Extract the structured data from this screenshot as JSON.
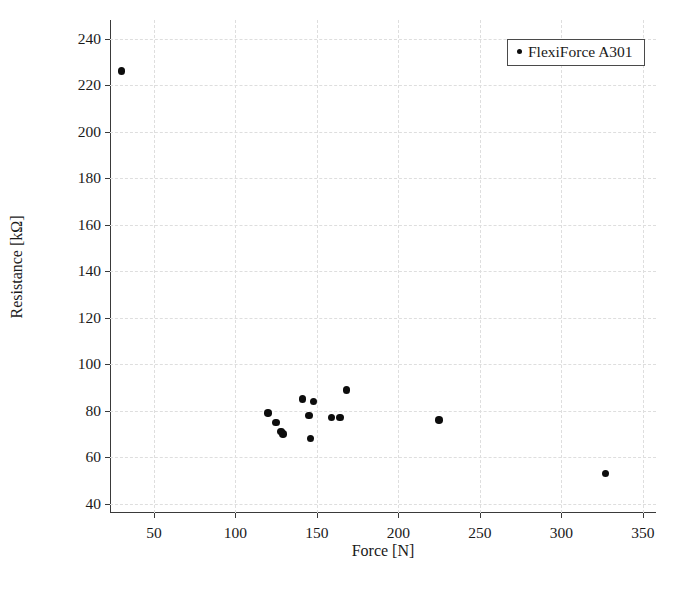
{
  "chart_data": {
    "type": "scatter",
    "title": "",
    "xlabel": "Force [N]",
    "ylabel": "Resistance [kΩ]",
    "xlim": [
      23,
      358
    ],
    "ylim": [
      36,
      248
    ],
    "xticks": [
      50,
      100,
      150,
      200,
      250,
      300,
      350
    ],
    "yticks": [
      40,
      60,
      80,
      100,
      120,
      140,
      160,
      180,
      200,
      220,
      240
    ],
    "grid": true,
    "legend_position": "top-right",
    "marker_color": "#0d0d0d",
    "grid_color": "#dedede",
    "axis_color": "#3a3a3a",
    "series": [
      {
        "name": "FlexiForce A301",
        "points": [
          {
            "x": 30,
            "y": 226
          },
          {
            "x": 120,
            "y": 79
          },
          {
            "x": 125,
            "y": 75
          },
          {
            "x": 128,
            "y": 71
          },
          {
            "x": 129,
            "y": 70
          },
          {
            "x": 141,
            "y": 85
          },
          {
            "x": 145,
            "y": 78
          },
          {
            "x": 148,
            "y": 84
          },
          {
            "x": 146,
            "y": 68
          },
          {
            "x": 159,
            "y": 77
          },
          {
            "x": 164,
            "y": 77
          },
          {
            "x": 168,
            "y": 89
          },
          {
            "x": 225,
            "y": 76
          },
          {
            "x": 327,
            "y": 53
          }
        ]
      }
    ]
  },
  "legend": {
    "entries": [
      {
        "label": "FlexiForce A301",
        "marker": "dot-marker"
      }
    ]
  }
}
